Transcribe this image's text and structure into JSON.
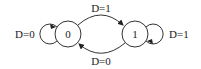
{
  "diagram": {
    "type": "state-machine",
    "states": [
      {
        "id": "0",
        "label": "0"
      },
      {
        "id": "1",
        "label": "1"
      }
    ],
    "transitions": [
      {
        "from": "0",
        "to": "0",
        "label": "D=0"
      },
      {
        "from": "0",
        "to": "1",
        "label": "D=1"
      },
      {
        "from": "1",
        "to": "0",
        "label": "D=0"
      },
      {
        "from": "1",
        "to": "1",
        "label": "D=1"
      }
    ],
    "colors": {
      "stroke": "#333333",
      "text": "#1a1a1a",
      "background": "#ffffff"
    }
  }
}
